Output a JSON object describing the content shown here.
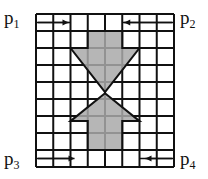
{
  "diagram": {
    "grid": {
      "columns": 8,
      "rows": 9,
      "split_rows": [
        "top",
        "bottom"
      ]
    },
    "labels": {
      "p1": {
        "base": "p",
        "sub": "1"
      },
      "p2": {
        "base": "p",
        "sub": "2"
      },
      "p3": {
        "base": "p",
        "sub": "3"
      },
      "p4": {
        "base": "p",
        "sub": "4"
      }
    },
    "small_arrows": [
      {
        "id": "p1-arrow",
        "direction": "right"
      },
      {
        "id": "p2-arrow",
        "direction": "left"
      },
      {
        "id": "p3-arrow",
        "direction": "right"
      },
      {
        "id": "p4-arrow",
        "direction": "left"
      }
    ],
    "big_arrows": [
      {
        "id": "down-arrow",
        "direction": "down"
      },
      {
        "id": "up-arrow",
        "direction": "up"
      }
    ],
    "colors": {
      "arrow_fill": "#a9a9a9",
      "line": "#111111"
    }
  }
}
